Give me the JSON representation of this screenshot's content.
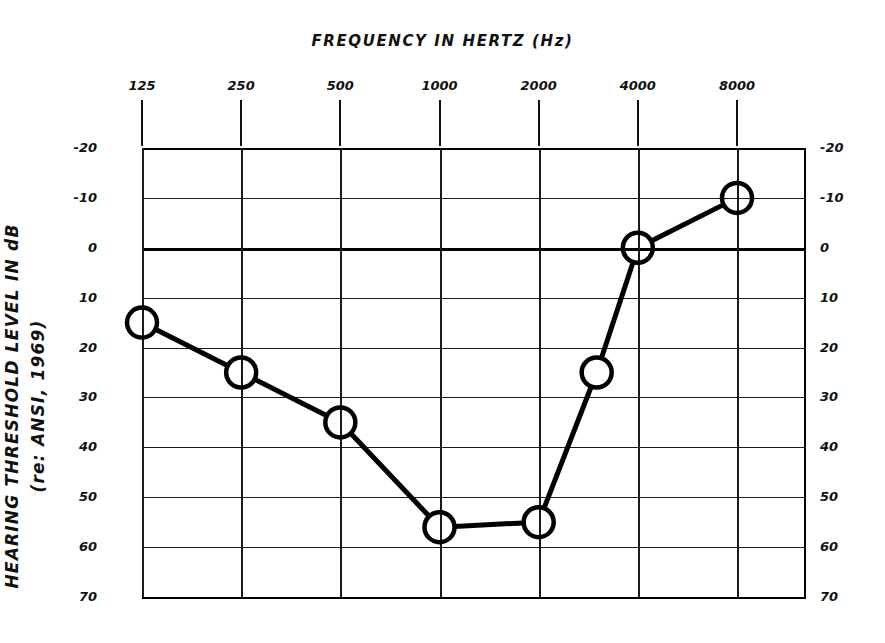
{
  "chart_data": {
    "type": "line",
    "title": "FREQUENCY IN HERTZ (Hz)",
    "xlabel": "FREQUENCY IN HERTZ (Hz)",
    "ylabel_line1": "HEARING THRESHOLD LEVEL IN dB",
    "ylabel_line2": "(re: ANSI, 1969)",
    "x_tick_labels": [
      "125",
      "250",
      "500",
      "1000",
      "2000",
      "4000",
      "8000"
    ],
    "x_tick_values": [
      125,
      250,
      500,
      1000,
      2000,
      4000,
      8000
    ],
    "y_tick_labels_left": [
      "-20",
      "-10",
      "0",
      "10",
      "20",
      "30",
      "40",
      "50",
      "60",
      "70"
    ],
    "y_tick_labels_right": [
      "-20",
      "-10",
      "0",
      "10",
      "20",
      "30",
      "40",
      "50",
      "60",
      "70"
    ],
    "y_tick_values": [
      -20,
      -10,
      0,
      10,
      20,
      30,
      40,
      50,
      60,
      70
    ],
    "ylim": [
      -20,
      70
    ],
    "y_axis_inverted": true,
    "grid": true,
    "legend": "none",
    "emphasized_gridline": 0,
    "line_color": "#000000",
    "marker": "open-circle",
    "series": [
      {
        "name": "air conduction threshold",
        "points": [
          {
            "freq": 125,
            "freq_label": "125",
            "level_db": 15
          },
          {
            "freq": 250,
            "freq_label": "250",
            "level_db": 25
          },
          {
            "freq": 500,
            "freq_label": "500",
            "level_db": 35
          },
          {
            "freq": 1000,
            "freq_label": "1000",
            "level_db": 56
          },
          {
            "freq": 2000,
            "freq_label": "2000",
            "level_db": 55
          },
          {
            "freq": 3000,
            "freq_label": "3000",
            "level_db": 25
          },
          {
            "freq": 4000,
            "freq_label": "4000",
            "level_db": 0
          },
          {
            "freq": 8000,
            "freq_label": "8000",
            "level_db": -10
          }
        ]
      }
    ]
  }
}
